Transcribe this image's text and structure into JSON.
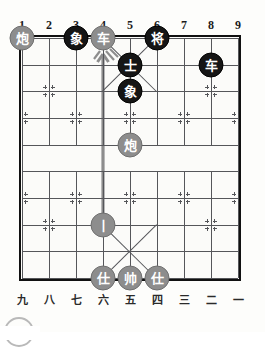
{
  "board": {
    "title": "Xiangqi Board Diagram",
    "columns": 9,
    "rows": 10,
    "top_labels": [
      "1",
      "2",
      "3",
      "4",
      "5",
      "6",
      "7",
      "8",
      "9"
    ],
    "bottom_labels": [
      "九",
      "八",
      "七",
      "六",
      "五",
      "四",
      "三",
      "二",
      "一"
    ],
    "colors": {
      "board_bg": "#fbfbf9",
      "line": "#55565a",
      "border": "#111111",
      "black_piece": "#151515",
      "grey_piece": "#8d8d8d",
      "piece_text": "#ffffff",
      "arrow": "#8d8d8d"
    },
    "pieces": [
      {
        "name": "cannon-grey-c1",
        "label": "炮",
        "side": "grey",
        "col": 1,
        "row": 0
      },
      {
        "name": "elephant-black-c3",
        "label": "象",
        "side": "black",
        "col": 3,
        "row": 0
      },
      {
        "name": "chariot-grey-c4",
        "label": "车",
        "side": "grey",
        "col": 4,
        "row": 0
      },
      {
        "name": "general-black-c6",
        "label": "将",
        "side": "black",
        "col": 6,
        "row": 0
      },
      {
        "name": "advisor-black-c5",
        "label": "士",
        "side": "black",
        "col": 5,
        "row": 1
      },
      {
        "name": "chariot-black-c8",
        "label": "车",
        "side": "black",
        "col": 8,
        "row": 1
      },
      {
        "name": "elephant-black-c5",
        "label": "象",
        "side": "black",
        "col": 5,
        "row": 2
      },
      {
        "name": "cannon-grey-c5",
        "label": "炮",
        "side": "grey",
        "col": 5,
        "row": 4
      },
      {
        "name": "soldier-grey-c4",
        "label": "丨",
        "side": "grey",
        "col": 4,
        "row": 7
      },
      {
        "name": "advisor-grey-c4",
        "label": "仕",
        "side": "grey",
        "col": 4,
        "row": 9
      },
      {
        "name": "general-grey-c5",
        "label": "帅",
        "side": "grey",
        "col": 5,
        "row": 9
      },
      {
        "name": "advisor-grey-c6",
        "label": "仕",
        "side": "grey",
        "col": 6,
        "row": 9
      }
    ],
    "move_arrow": {
      "name": "move-arrow",
      "from_col": 4,
      "from_row": 7,
      "to_col": 4,
      "to_row": 0,
      "color": "#8d8d8d"
    },
    "star_points": [
      {
        "col": 2,
        "row": 2
      },
      {
        "col": 8,
        "row": 2
      },
      {
        "col": 1,
        "row": 3
      },
      {
        "col": 3,
        "row": 3
      },
      {
        "col": 5,
        "row": 3
      },
      {
        "col": 7,
        "row": 3
      },
      {
        "col": 9,
        "row": 3
      },
      {
        "col": 1,
        "row": 6
      },
      {
        "col": 3,
        "row": 6
      },
      {
        "col": 5,
        "row": 6
      },
      {
        "col": 7,
        "row": 6
      },
      {
        "col": 9,
        "row": 6
      },
      {
        "col": 2,
        "row": 7
      },
      {
        "col": 8,
        "row": 7
      }
    ]
  }
}
